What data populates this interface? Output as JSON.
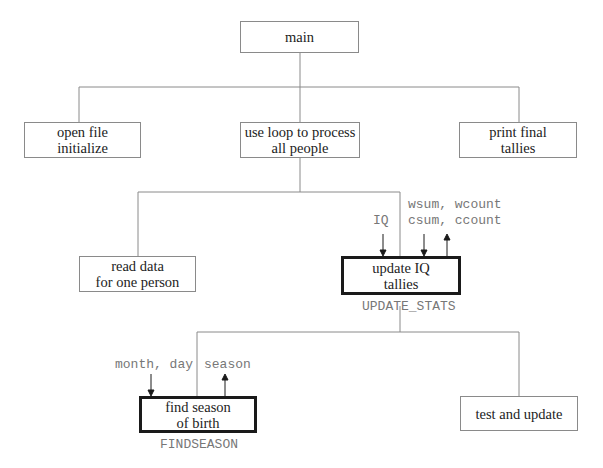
{
  "diagram": {
    "type": "structure chart",
    "nodes": {
      "main": {
        "label": "main"
      },
      "open_file": {
        "label": "open file\ninitialize"
      },
      "loop": {
        "label": "use loop to process\nall people"
      },
      "print_final": {
        "label": "print final\ntallies"
      },
      "read_data": {
        "label": "read data\nfor one person"
      },
      "update_iq": {
        "label": "update IQ\ntallies",
        "module_name": "UPDATE_STATS"
      },
      "find_season": {
        "label": "find season\nof birth",
        "module_name": "FINDSEASON"
      },
      "test_update": {
        "label": "test and update"
      }
    },
    "parameters": {
      "update_iq_in_iq": "IQ",
      "update_iq_top": "wsum, wcount",
      "update_iq_bottom": "csum, ccount",
      "find_season_in": "month, day",
      "find_season_out": "season"
    },
    "edges": [
      [
        "main",
        "open_file"
      ],
      [
        "main",
        "loop"
      ],
      [
        "main",
        "print_final"
      ],
      [
        "loop",
        "read_data"
      ],
      [
        "loop",
        "update_iq"
      ],
      [
        "update_iq",
        "find_season"
      ],
      [
        "update_iq",
        "test_update"
      ]
    ],
    "colors": {
      "line": "#8a8a8a",
      "bold_border": "#1a1a1a",
      "param_text": "#777777",
      "text": "#222222"
    }
  }
}
